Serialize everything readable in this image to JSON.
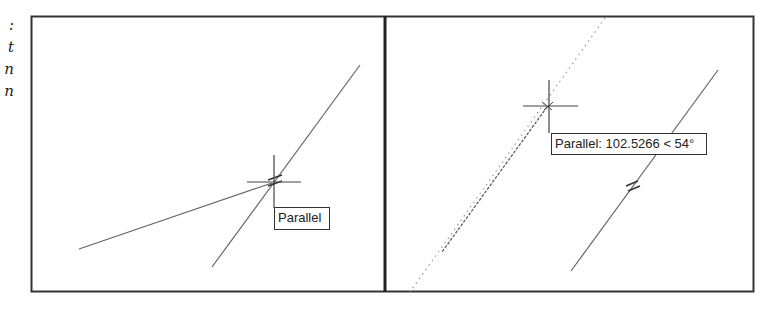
{
  "side_text_fragments": [
    ":",
    "t",
    "n",
    "n"
  ],
  "colors": {
    "frame": "#333333",
    "line": "#666666",
    "tracking_line": "#999999",
    "tooltip_border": "#333333",
    "text": "#222222"
  },
  "frame": {
    "x": 31,
    "y": 16,
    "width": 722,
    "height": 276,
    "divider_x": 385
  },
  "left_panel": {
    "lines": [
      {
        "x1": 79,
        "y1": 249,
        "x2": 272,
        "y2": 183
      },
      {
        "x1": 212,
        "y1": 267,
        "x2": 360,
        "y2": 65
      }
    ],
    "crosshair": {
      "cx": 274,
      "cy": 182,
      "half": 27
    },
    "tooltip": {
      "label": "Parallel",
      "x": 274,
      "y": 207,
      "width": 56,
      "height": 23
    }
  },
  "right_panel": {
    "solid_line": {
      "x1": 718,
      "y1": 70,
      "x2": 571,
      "y2": 271
    },
    "dotted_line": {
      "x1": 605,
      "y1": 18,
      "x2": 410,
      "y2": 292
    },
    "rubber_band": {
      "x1": 547,
      "y1": 107,
      "x2": 442,
      "y2": 252
    },
    "crosshair": {
      "cx": 549,
      "cy": 106,
      "half": 27
    },
    "tooltip": {
      "label": "Parallel: 102.5266 < 54°",
      "x": 551,
      "y": 133,
      "width": 156,
      "height": 22
    }
  }
}
